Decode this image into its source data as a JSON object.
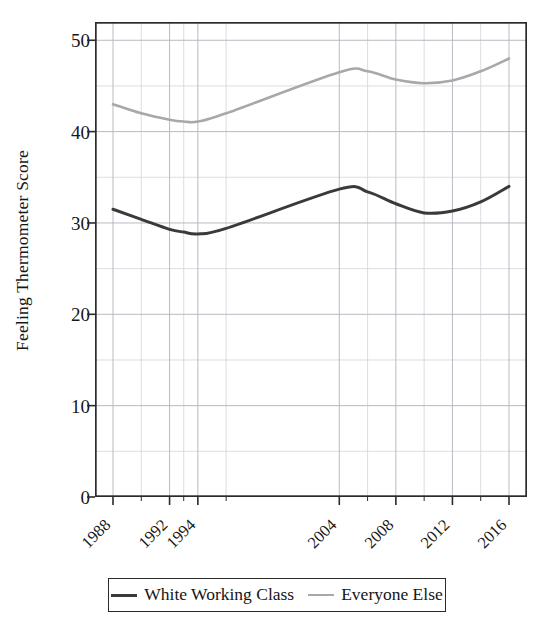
{
  "chart_data": {
    "type": "line",
    "title": "",
    "subtitle": "",
    "xlabel": "",
    "ylabel": "Feeling Thermometer Score",
    "ylim": [
      0,
      52
    ],
    "xlim": [
      1988,
      2016
    ],
    "grid": true,
    "legend_position": "bottom",
    "ytick_labels": [
      "50",
      "40",
      "30",
      "20",
      "10",
      "0"
    ],
    "ytick_values": [
      50,
      40,
      30,
      20,
      10,
      0
    ],
    "yminor_values": [
      45,
      35,
      25,
      15,
      5
    ],
    "xtick_labels": [
      "1988",
      "1992",
      "1994",
      "2004",
      "2008",
      "2012",
      "2016"
    ],
    "xtick_values": [
      1988,
      1992,
      1994,
      2004,
      2008,
      2012,
      2016
    ],
    "xminor_values": [
      1990,
      1993,
      1996,
      2006,
      2010,
      2014
    ],
    "x": [
      1988,
      1990,
      1992,
      1993,
      1994,
      1996,
      2004,
      2006,
      2008,
      2010,
      2012,
      2014,
      2016
    ],
    "series": [
      {
        "name": "White Working Class",
        "color": "#3a3a3a",
        "width": 3.0,
        "values": [
          31.5,
          30.4,
          29.3,
          29.0,
          28.8,
          29.4,
          33.7,
          33.4,
          32.1,
          31.1,
          31.3,
          32.3,
          34.0
        ]
      },
      {
        "name": "Everyone Else",
        "color": "#a8a8a8",
        "width": 2.6,
        "values": [
          43.0,
          42.0,
          41.3,
          41.1,
          41.1,
          42.0,
          46.5,
          46.6,
          45.7,
          45.3,
          45.6,
          46.6,
          48.0
        ]
      }
    ]
  },
  "legend": {
    "entries": [
      {
        "label": "White Working Class",
        "color": "#3a3a3a"
      },
      {
        "label": "Everyone Else",
        "color": "#a8a8a8"
      }
    ]
  },
  "axes": {
    "y_title": "Feeling Thermometer Score"
  },
  "colors": {
    "frame": "#2b2b2b",
    "grid_major": "#b9b9c4",
    "grid_minor": "#d8d8df",
    "text": "#171717",
    "background": "#ffffff"
  }
}
